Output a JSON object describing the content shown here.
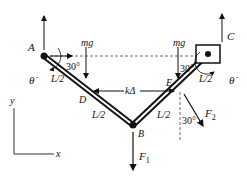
{
  "diagram": {
    "points": {
      "A": "A",
      "B": "B",
      "C": "C",
      "D": "D",
      "E": "E"
    },
    "labels": {
      "mg_left": "mg",
      "mg_right": "mg",
      "angle_left": "30°",
      "angle_right": "30°",
      "angle_f2": "30°",
      "theta_dot_left": "θ̇",
      "theta_dot_right": "θ̇",
      "L2_a": "L/2",
      "L2_b": "L/2",
      "L2_c": "L/2",
      "L2_d": "L/2",
      "spring": "kΔ",
      "F1": "F",
      "F1_sub": "1",
      "F2": "F",
      "F2_sub": "2",
      "axis_x": "x",
      "axis_y": "y"
    }
  }
}
